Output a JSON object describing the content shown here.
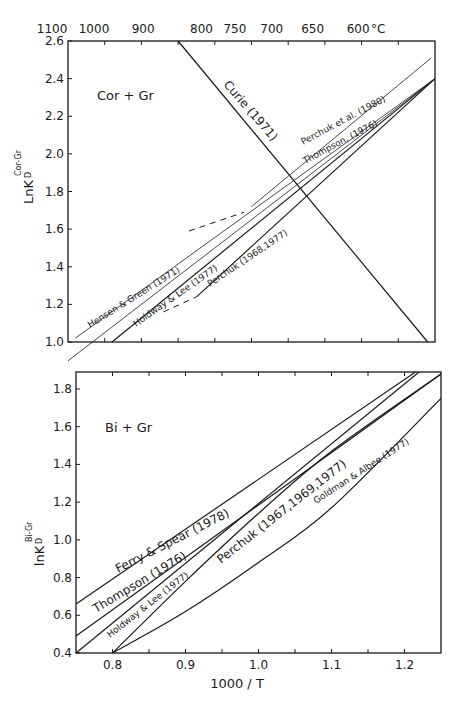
{
  "chart_data": [
    {
      "type": "line",
      "panel_label": "Cor + Gr",
      "title": "",
      "xlabel": "1000 / T",
      "ylabel": "LnK_D^{Cor-Gr}",
      "ylabel_main": "LnK",
      "ylabel_sub": "D",
      "ylabel_sup": "Cor-Gr",
      "xlim": [
        0.75,
        1.25
      ],
      "ylim": [
        1.0,
        2.6
      ],
      "y_ticks": [
        1.0,
        1.2,
        1.4,
        1.6,
        1.8,
        2.0,
        2.2,
        2.4,
        2.6
      ],
      "y_tick_labels": [
        "1.0",
        "1.2",
        "1.4",
        "1.6",
        "1.8",
        "2.0",
        "2.2",
        "2.4",
        "2.6"
      ],
      "x_ticks": [
        0.8,
        0.85,
        0.9,
        0.95,
        1.0,
        1.05,
        1.1,
        1.15,
        1.2
      ],
      "top_axis": {
        "unit": "°C",
        "labels": [
          "1100",
          "1000",
          "900",
          "800",
          "750",
          "700",
          "650",
          "600"
        ],
        "temperatures_C": [
          1100,
          1000,
          900,
          800,
          750,
          700,
          650,
          600
        ]
      },
      "grid": false,
      "legend": "inline labels",
      "series": [
        {
          "name": "Curie (1971)",
          "style": "solid",
          "x": [
            0.9,
            1.24
          ],
          "y": [
            2.6,
            1.0
          ]
        },
        {
          "name": "Perchuk et al. (1980)",
          "style": "solid-thin",
          "x": [
            1.0,
            1.245
          ],
          "y": [
            1.72,
            2.51
          ]
        },
        {
          "name": "Perchuk et al. (1980) extrapolated",
          "style": "dashed",
          "x": [
            0.915,
            0.99
          ],
          "y": [
            1.59,
            1.69
          ]
        },
        {
          "name": "Thompson, (1976)",
          "style": "solid-thin",
          "x": [
            0.75,
            1.25
          ],
          "y": [
            0.9,
            2.4
          ]
        },
        {
          "name": "Hensen & Green (1971)",
          "style": "solid-thin",
          "x": [
            0.76,
            1.25
          ],
          "y": [
            1.02,
            2.4
          ]
        },
        {
          "name": "Holdway & Lee (1977)",
          "style": "solid",
          "x": [
            0.81,
            1.25
          ],
          "y": [
            1.0,
            2.4
          ]
        },
        {
          "name": "Perchuk (1968, 1977)",
          "style": "solid",
          "x": [
            0.925,
            1.25
          ],
          "y": [
            1.24,
            2.4
          ]
        },
        {
          "name": "Perchuk (1968, 1977) extrapolated",
          "style": "dashed",
          "x": [
            0.88,
            0.925
          ],
          "y": [
            1.16,
            1.24
          ]
        }
      ],
      "labels": [
        {
          "text": "Curie (1971)"
        },
        {
          "text": "Perchuk et al. (1980)"
        },
        {
          "text": "Thompson, (1976)"
        },
        {
          "text": "Hensen & Green (1971)"
        },
        {
          "text": "Holdway & Lee (1977)"
        },
        {
          "text": "Perchuk (1968,1977)"
        }
      ]
    },
    {
      "type": "line",
      "panel_label": "Bi + Gr",
      "title": "",
      "xlabel": "1000 / T",
      "ylabel": "lnK_D^{Bi-Gr}",
      "ylabel_main": "lnK",
      "ylabel_sub": "D",
      "ylabel_sup": "Bi-Gr",
      "xlim": [
        0.75,
        1.25
      ],
      "ylim": [
        0.4,
        1.89
      ],
      "x_ticks": [
        0.8,
        0.85,
        0.9,
        0.95,
        1.0,
        1.05,
        1.1,
        1.15,
        1.2
      ],
      "x_tick_labels": [
        "0.8",
        "0.9",
        "1.0",
        "1.1",
        "1.2"
      ],
      "x_tick_label_values": [
        0.8,
        0.9,
        1.0,
        1.1,
        1.2
      ],
      "y_ticks": [
        0.4,
        0.6,
        0.8,
        1.0,
        1.2,
        1.4,
        1.6,
        1.8
      ],
      "y_tick_labels": [
        "0.4",
        "0.6",
        "0.8",
        "1.0",
        "1.2",
        "1.4",
        "1.6",
        "1.8"
      ],
      "grid": false,
      "legend": "inline labels",
      "series": [
        {
          "name": "Ferry & Spear (1978)",
          "style": "solid",
          "x": [
            0.75,
            1.215
          ],
          "y": [
            0.66,
            1.89
          ]
        },
        {
          "name": "Thompson (1976)",
          "style": "solid",
          "x": [
            0.75,
            1.25
          ],
          "y": [
            0.49,
            1.88
          ]
        },
        {
          "name": "Holdway & Lee (1977)",
          "style": "solid",
          "x": [
            0.75,
            1.22
          ],
          "y": [
            0.4,
            1.89
          ]
        },
        {
          "name": "Perchuk (1967,1969,1977)",
          "style": "solid",
          "x": [
            0.8,
            0.9,
            1.0,
            1.1,
            1.25
          ],
          "y": [
            0.4,
            0.78,
            1.14,
            1.47,
            1.88
          ]
        },
        {
          "name": "Goldman & Albee (1977)",
          "style": "solid",
          "x": [
            0.8,
            0.9,
            1.0,
            1.1,
            1.25
          ],
          "y": [
            0.4,
            0.62,
            0.88,
            1.17,
            1.75
          ]
        }
      ],
      "labels": [
        {
          "text": "Ferry & Spear (1978)"
        },
        {
          "text": "Thompson (1976)"
        },
        {
          "text": "Holdway & Lee (1977)"
        },
        {
          "text": "Perchuk (1967,1969,1977)"
        },
        {
          "text": "Goldman & Albee (1977)"
        }
      ]
    }
  ]
}
